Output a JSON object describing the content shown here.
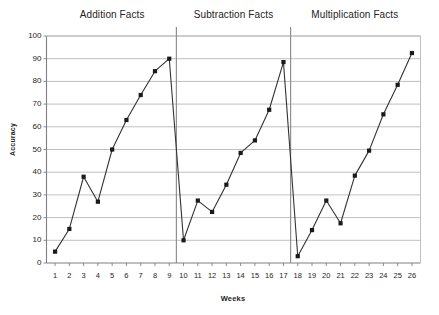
{
  "chart_data": {
    "type": "line",
    "title": "",
    "xlabel": "Weeks",
    "ylabel": "Accuracy",
    "xlim": [
      0.4,
      26.6
    ],
    "ylim": [
      0,
      100
    ],
    "grid": "horizontal",
    "legend": "none",
    "marker": "filled-square",
    "line_color": "#333333",
    "marker_color": "#1a1a1a",
    "grid_color": "#b8b8b8",
    "axis_color": "#808080",
    "x": [
      1,
      2,
      3,
      4,
      5,
      6,
      7,
      8,
      9,
      10,
      11,
      12,
      13,
      14,
      15,
      16,
      17,
      18,
      19,
      20,
      21,
      22,
      23,
      24,
      25,
      26
    ],
    "categories": [
      "1",
      "2",
      "3",
      "4",
      "5",
      "6",
      "7",
      "8",
      "9",
      "10",
      "11",
      "12",
      "13",
      "14",
      "15",
      "16",
      "17",
      "18",
      "19",
      "20",
      "21",
      "22",
      "23",
      "24",
      "25",
      "26"
    ],
    "values": [
      5,
      15,
      38,
      27,
      50,
      63,
      74,
      84.5,
      90,
      10,
      27.5,
      22.5,
      34.5,
      48.5,
      54,
      67.5,
      88.5,
      3,
      14.5,
      27.5,
      17.5,
      38.5,
      49.5,
      65.5,
      78.5,
      92.5
    ],
    "ytick_labels": [
      "0",
      "10",
      "20",
      "30",
      "40",
      "50",
      "60",
      "70",
      "80",
      "90",
      "100"
    ],
    "ytick_values": [
      0,
      10,
      20,
      30,
      40,
      50,
      60,
      70,
      80,
      90,
      100
    ],
    "phases": [
      {
        "label": "Addition Facts",
        "start_week": 1,
        "end_week": 9
      },
      {
        "label": "Subtraction Facts",
        "start_week": 10,
        "end_week": 17
      },
      {
        "label": "Multiplication Facts",
        "start_week": 18,
        "end_week": 26
      }
    ],
    "phase_dividers": [
      9.5,
      17.5
    ],
    "series": [
      {
        "name": "Accuracy",
        "values": [
          5,
          15,
          38,
          27,
          50,
          63,
          74,
          84.5,
          90,
          10,
          27.5,
          22.5,
          34.5,
          48.5,
          54,
          67.5,
          88.5,
          3,
          14.5,
          27.5,
          17.5,
          38.5,
          49.5,
          65.5,
          78.5,
          92.5
        ]
      }
    ]
  }
}
